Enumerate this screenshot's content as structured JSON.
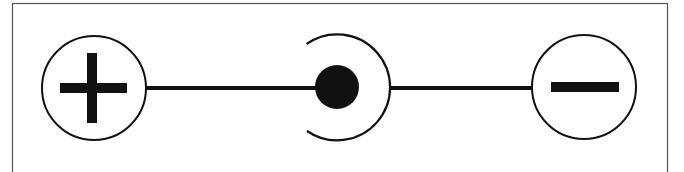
{
  "diagram": {
    "type": "dc-polarity-symbol",
    "left_terminal": {
      "symbol": "plus",
      "meaning": "positive"
    },
    "center": {
      "symbol": "filled-dot-in-c-arc",
      "meaning": "connector"
    },
    "right_terminal": {
      "symbol": "minus",
      "meaning": "negative"
    },
    "colors": {
      "stroke": "#111111",
      "border": "#555555",
      "background": "#ffffff"
    }
  }
}
